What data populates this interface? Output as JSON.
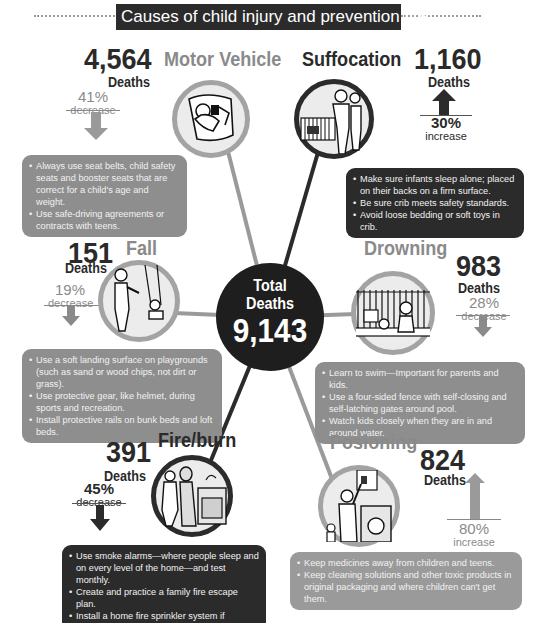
{
  "title": "Causes of child injury and prevention tips",
  "total": {
    "label_line1": "Total",
    "label_line2": "Deaths",
    "value": "9,143"
  },
  "colors": {
    "dark": "#2b2b2b",
    "mid_gray": "#8c8c8c",
    "light_gray": "#a0a0a0",
    "text_dark": "#2a2a2a",
    "text_gray": "#7a7a7a"
  },
  "causes": [
    {
      "id": "motor-vehicle",
      "name": "Motor Vehicle",
      "deaths": "4,564",
      "deaths_label": "Deaths",
      "change_pct": "41%",
      "change_dir": "decrease",
      "arrow": "down-arrow",
      "tips": [
        "Always use seat belts, child safety seats and booster seats that are correct for a child's age and weight.",
        "Use safe-driving agreements or contracts with teens."
      ]
    },
    {
      "id": "suffocation",
      "name": "Suffocation",
      "deaths": "1,160",
      "deaths_label": "Deaths",
      "change_pct": "30%",
      "change_dir": "increase",
      "arrow": "up-arrow",
      "tips": [
        "Make sure infants sleep alone; placed on their backs on a firm surface.",
        "Be sure crib meets safety standards.",
        "Avoid loose bedding or soft toys in crib."
      ]
    },
    {
      "id": "fall",
      "name": "Fall",
      "deaths": "151",
      "deaths_label": "Deaths",
      "change_pct": "19%",
      "change_dir": "decrease",
      "arrow": "down-arrow",
      "tips": [
        "Use a soft landing surface on playgrounds (such as sand or wood chips, not dirt or grass).",
        "Use protective gear, like helmet, during sports and recreation.",
        "Install protective rails on bunk beds and loft beds."
      ]
    },
    {
      "id": "drowning",
      "name": "Drowning",
      "deaths": "983",
      "deaths_label": "Deaths",
      "change_pct": "28%",
      "change_dir": "decrease",
      "arrow": "down-arrow",
      "tips": [
        "Learn to swim—Important for parents and kids.",
        "Use a four-sided fence with self-closing and self-latching gates around pool.",
        "Watch kids closely when they are in and around water."
      ]
    },
    {
      "id": "fire-burn",
      "name": "Fire/burn",
      "deaths": "391",
      "deaths_label": "Deaths",
      "change_pct": "45%",
      "change_dir": "decrease",
      "arrow": "down-arrow",
      "tips": [
        "Use smoke alarms—where people sleep and on every level of the home—and test monthly.",
        "Create and practice a family fire escape plan.",
        "Install a home fire sprinkler system if possible."
      ]
    },
    {
      "id": "poisoning",
      "name": "Posioning",
      "deaths": "824",
      "deaths_label": "Deaths",
      "change_pct": "80%",
      "change_dir": "increase",
      "arrow": "up-arrow",
      "tips": [
        "Keep medicines away from children and teens.",
        "Keep cleaning solutions and other toxic products in original packaging and where children can't get them."
      ]
    }
  ]
}
